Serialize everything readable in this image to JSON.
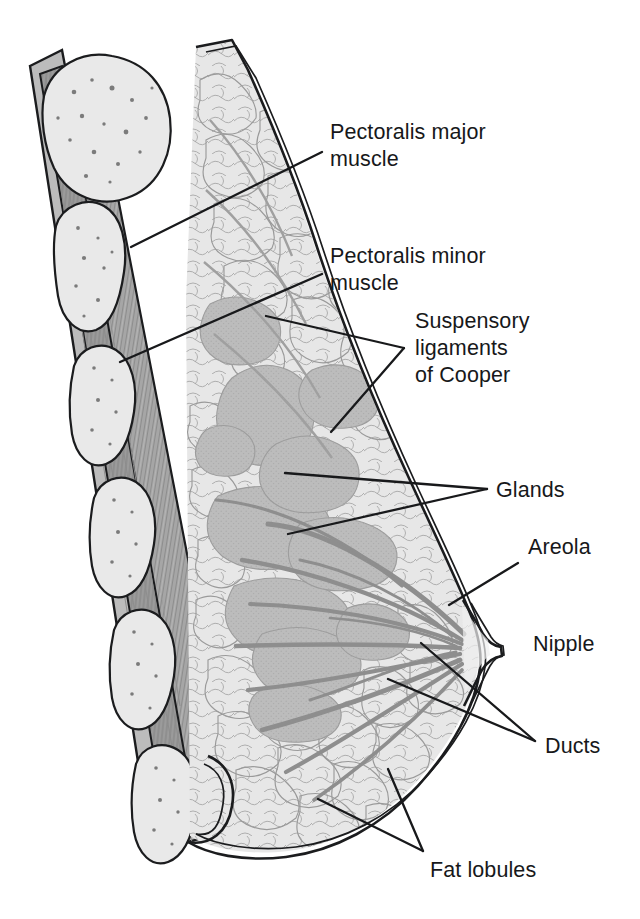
{
  "figure": {
    "view": "sagittal cross-section",
    "background_color": "#ffffff",
    "line_color": "#1b1c1e"
  },
  "palette": {
    "fat": "#e7e7e7",
    "fat_outline": "#9a9a9a",
    "gland": "#bcbcbc",
    "gland_dark": "#b0b0b0",
    "muscle_major": "#a6a6a6",
    "muscle_minor": "#9a9a9a",
    "rib_bone": "#e9e9e9",
    "rib_speckle": "#7b7b7b",
    "duct": "#8e8e8e",
    "skin": "#f2f2f2",
    "label_text": "#17181a"
  },
  "labels": [
    {
      "id": "pectoralis-major",
      "text_lines": [
        "Pectoralis major",
        "muscle"
      ],
      "x": 330,
      "y": 131,
      "leader": "from label to deep chest-wall muscle layer"
    },
    {
      "id": "pectoralis-minor",
      "text_lines": [
        "Pectoralis minor",
        "muscle"
      ],
      "x": 330,
      "y": 255,
      "leader": "from label to inner chest-wall muscle layer"
    },
    {
      "id": "suspensory-ligaments",
      "text_lines": [
        "Suspensory",
        "ligaments",
        "of Cooper"
      ],
      "x": 415,
      "y": 320,
      "leader": "two lines to fibrous septa in upper breast"
    },
    {
      "id": "glands",
      "text_lines": [
        "Glands"
      ],
      "x": 496,
      "y": 489,
      "leader": "two lines to grey glandular lobes"
    },
    {
      "id": "areola",
      "text_lines": [
        "Areola"
      ],
      "x": 528,
      "y": 546,
      "leader": "one line to pigmented skin around nipple"
    },
    {
      "id": "nipple",
      "text_lines": [
        "Nipple"
      ],
      "x": 533,
      "y": 643,
      "leader": "none, adjacent to nipple tip"
    },
    {
      "id": "ducts",
      "text_lines": [
        "Ducts"
      ],
      "x": 545,
      "y": 745,
      "leader": "two lines to lactiferous ducts converging at nipple"
    },
    {
      "id": "fat-lobules",
      "text_lines": [
        "Fat lobules"
      ],
      "x": 430,
      "y": 869,
      "leader": "two lines to pale adipose lobules"
    }
  ],
  "structures": [
    {
      "name": "ribs",
      "count": 7,
      "description": "rib cross-sections with trabecular bone speckling"
    },
    {
      "name": "pectoralis major muscle",
      "description": "striated grey band of chest wall"
    },
    {
      "name": "pectoralis minor muscle",
      "description": "deeper striated grey band"
    },
    {
      "name": "fat lobules",
      "description": "pale polygonal adipose cells filling the breast"
    },
    {
      "name": "glandular lobes",
      "description": "medium-grey amoeboid lobules"
    },
    {
      "name": "lactiferous ducts",
      "description": "thin grey streaks radiating toward the nipple"
    },
    {
      "name": "suspensory ligaments of Cooper",
      "description": "fibrous septa between skin and chest wall"
    },
    {
      "name": "skin",
      "description": "double-line outer contour with inframammary fold"
    },
    {
      "name": "nipple",
      "description": "central protrusion at breast apex"
    },
    {
      "name": "areola",
      "description": "skin region surrounding the nipple"
    }
  ]
}
